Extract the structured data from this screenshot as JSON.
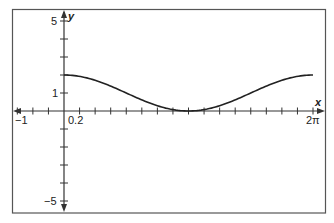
{
  "chart_data": {
    "type": "line",
    "title": "",
    "xlabel": "x",
    "ylabel": "y",
    "function": "y = 1 + cos(x)",
    "xlim": [
      -1,
      6.2832
    ],
    "ylim": [
      -5,
      5
    ],
    "x_tick_labels": [
      "-1",
      "0.2",
      "2π"
    ],
    "y_tick_labels": [
      "5",
      "1",
      "-5"
    ],
    "x_tick_spacing": "π/8",
    "y_tick_spacing": 1,
    "grid": false,
    "frame": true,
    "series": [
      {
        "name": "curve",
        "x": [
          0,
          0.7854,
          1.5708,
          2.3562,
          3.1416,
          3.927,
          4.7124,
          5.4978,
          6.2832
        ],
        "values": [
          2,
          1.707,
          1,
          0.293,
          0,
          0.293,
          1,
          1.707,
          2
        ]
      }
    ]
  },
  "labels": {
    "x_axis": "x",
    "y_axis": "y",
    "x_neg_one": "−1",
    "x_small": "0.2",
    "x_two_pi": "2π",
    "y_five": "5",
    "y_one": "1",
    "y_neg_five": "−5"
  }
}
